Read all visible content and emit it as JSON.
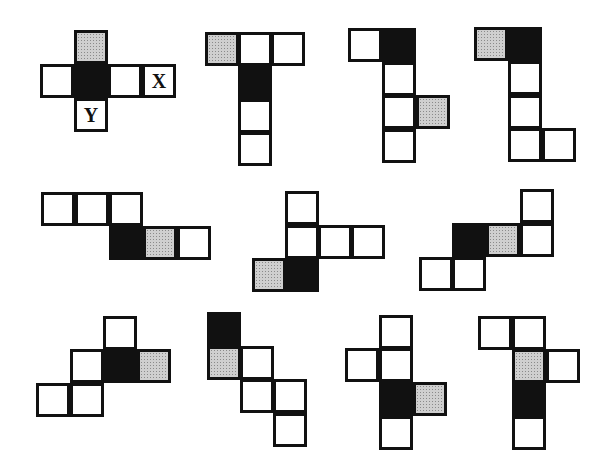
{
  "diagram": {
    "colors": {
      "black": "#111111",
      "gray": "#cfcfcf",
      "white": "#ffffff",
      "border": "#111111"
    },
    "cell_size": 34,
    "nets": [
      {
        "id": "reference",
        "cells": [
          {
            "x": 74,
            "y": 30,
            "fill": "gray"
          },
          {
            "x": 40,
            "y": 64,
            "fill": "white"
          },
          {
            "x": 74,
            "y": 64,
            "fill": "black"
          },
          {
            "x": 108,
            "y": 64,
            "fill": "white"
          },
          {
            "x": 142,
            "y": 64,
            "fill": "white",
            "label": "X"
          },
          {
            "x": 74,
            "y": 98,
            "fill": "white",
            "label": "Y"
          }
        ]
      },
      {
        "id": "option-1",
        "cells": [
          {
            "x": 205,
            "y": 32,
            "fill": "gray"
          },
          {
            "x": 238,
            "y": 32,
            "fill": "white"
          },
          {
            "x": 271,
            "y": 32,
            "fill": "white"
          },
          {
            "x": 238,
            "y": 66,
            "fill": "black"
          },
          {
            "x": 238,
            "y": 99,
            "fill": "white"
          },
          {
            "x": 238,
            "y": 132,
            "fill": "white"
          }
        ]
      },
      {
        "id": "option-2",
        "cells": [
          {
            "x": 348,
            "y": 28,
            "fill": "white"
          },
          {
            "x": 382,
            "y": 28,
            "fill": "black"
          },
          {
            "x": 382,
            "y": 62,
            "fill": "white"
          },
          {
            "x": 382,
            "y": 95,
            "fill": "white"
          },
          {
            "x": 416,
            "y": 95,
            "fill": "gray"
          },
          {
            "x": 382,
            "y": 129,
            "fill": "white"
          }
        ]
      },
      {
        "id": "option-3",
        "cells": [
          {
            "x": 474,
            "y": 27,
            "fill": "gray"
          },
          {
            "x": 508,
            "y": 27,
            "fill": "black"
          },
          {
            "x": 508,
            "y": 61,
            "fill": "white"
          },
          {
            "x": 508,
            "y": 95,
            "fill": "white"
          },
          {
            "x": 508,
            "y": 128,
            "fill": "white"
          },
          {
            "x": 542,
            "y": 128,
            "fill": "white"
          }
        ]
      },
      {
        "id": "option-4",
        "cells": [
          {
            "x": 41,
            "y": 192,
            "fill": "white"
          },
          {
            "x": 75,
            "y": 192,
            "fill": "white"
          },
          {
            "x": 109,
            "y": 192,
            "fill": "white"
          },
          {
            "x": 109,
            "y": 226,
            "fill": "black"
          },
          {
            "x": 143,
            "y": 226,
            "fill": "gray"
          },
          {
            "x": 177,
            "y": 226,
            "fill": "white"
          }
        ]
      },
      {
        "id": "option-5",
        "cells": [
          {
            "x": 285,
            "y": 191,
            "fill": "white"
          },
          {
            "x": 285,
            "y": 225,
            "fill": "white"
          },
          {
            "x": 318,
            "y": 225,
            "fill": "white"
          },
          {
            "x": 351,
            "y": 225,
            "fill": "white"
          },
          {
            "x": 252,
            "y": 258,
            "fill": "gray"
          },
          {
            "x": 285,
            "y": 258,
            "fill": "black"
          }
        ]
      },
      {
        "id": "option-6",
        "cells": [
          {
            "x": 520,
            "y": 189,
            "fill": "white"
          },
          {
            "x": 452,
            "y": 223,
            "fill": "black"
          },
          {
            "x": 486,
            "y": 223,
            "fill": "gray"
          },
          {
            "x": 520,
            "y": 223,
            "fill": "white"
          },
          {
            "x": 419,
            "y": 257,
            "fill": "white"
          },
          {
            "x": 452,
            "y": 257,
            "fill": "white"
          }
        ]
      },
      {
        "id": "option-7",
        "cells": [
          {
            "x": 103,
            "y": 316,
            "fill": "white"
          },
          {
            "x": 70,
            "y": 349,
            "fill": "white"
          },
          {
            "x": 103,
            "y": 349,
            "fill": "black"
          },
          {
            "x": 137,
            "y": 349,
            "fill": "gray"
          },
          {
            "x": 36,
            "y": 383,
            "fill": "white"
          },
          {
            "x": 70,
            "y": 383,
            "fill": "white"
          }
        ]
      },
      {
        "id": "option-8",
        "cells": [
          {
            "x": 207,
            "y": 312,
            "fill": "black"
          },
          {
            "x": 207,
            "y": 346,
            "fill": "gray"
          },
          {
            "x": 240,
            "y": 346,
            "fill": "white"
          },
          {
            "x": 240,
            "y": 379,
            "fill": "white"
          },
          {
            "x": 273,
            "y": 379,
            "fill": "white"
          },
          {
            "x": 273,
            "y": 413,
            "fill": "white"
          }
        ]
      },
      {
        "id": "option-9",
        "cells": [
          {
            "x": 379,
            "y": 315,
            "fill": "white"
          },
          {
            "x": 345,
            "y": 348,
            "fill": "white"
          },
          {
            "x": 379,
            "y": 348,
            "fill": "white"
          },
          {
            "x": 379,
            "y": 382,
            "fill": "black"
          },
          {
            "x": 413,
            "y": 382,
            "fill": "gray"
          },
          {
            "x": 379,
            "y": 416,
            "fill": "white"
          }
        ]
      },
      {
        "id": "option-10",
        "cells": [
          {
            "x": 478,
            "y": 316,
            "fill": "white"
          },
          {
            "x": 512,
            "y": 316,
            "fill": "white"
          },
          {
            "x": 512,
            "y": 349,
            "fill": "gray"
          },
          {
            "x": 546,
            "y": 349,
            "fill": "white"
          },
          {
            "x": 512,
            "y": 382,
            "fill": "black"
          },
          {
            "x": 512,
            "y": 416,
            "fill": "white"
          }
        ]
      }
    ]
  }
}
